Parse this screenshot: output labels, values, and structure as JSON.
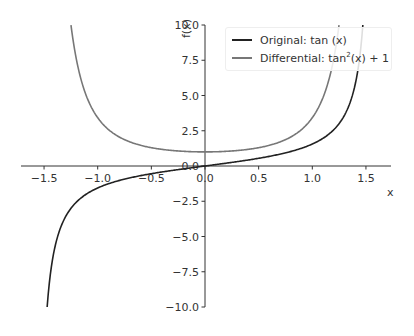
{
  "chart_data": {
    "type": "line",
    "title": "",
    "xlabel": "x",
    "ylabel": "f(x)",
    "xlim": [
      -1.75,
      1.75
    ],
    "ylim": [
      -10,
      10
    ],
    "grid": false,
    "legend_position": "upper right",
    "x_ticks": [
      "−1.5",
      "−1.0",
      "−0.5",
      "0.0",
      "0.5",
      "1.0",
      "1.5"
    ],
    "y_ticks": [
      "−10.0",
      "−7.5",
      "−5.0",
      "−2.5",
      "0.0",
      "2.5",
      "5.0",
      "7.5",
      "10.0"
    ],
    "series": [
      {
        "name": "Original: tan(x)",
        "color": "#222222",
        "x": [
          -1.47,
          -1.4,
          -1.3,
          -1.2,
          -1.0,
          -0.75,
          -0.5,
          -0.25,
          0.0,
          0.25,
          0.5,
          0.75,
          1.0,
          1.2,
          1.3,
          1.4,
          1.47
        ],
        "values": [
          -9.89,
          -5.8,
          -3.6,
          -2.57,
          -1.56,
          -0.93,
          -0.55,
          -0.26,
          0.0,
          0.26,
          0.55,
          0.93,
          1.56,
          2.57,
          3.6,
          5.8,
          9.89
        ]
      },
      {
        "name": "Differential: tan²(x) + 1",
        "color": "#777777",
        "x": [
          -1.25,
          -1.2,
          -1.1,
          -1.0,
          -0.75,
          -0.5,
          -0.25,
          0.0,
          0.25,
          0.5,
          0.75,
          1.0,
          1.1,
          1.2,
          1.25
        ],
        "values": [
          10.0,
          7.62,
          5.07,
          3.43,
          1.87,
          1.3,
          1.06,
          1.0,
          1.06,
          1.3,
          1.87,
          3.43,
          5.07,
          7.62,
          10.0
        ]
      }
    ]
  },
  "legend": {
    "item0": "Original: tan (x)",
    "item1_prefix": "Differential: tan",
    "item1_sup": "2",
    "item1_suffix": "(x) + 1"
  }
}
